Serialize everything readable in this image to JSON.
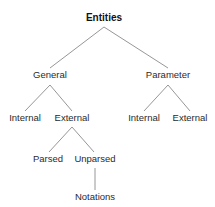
{
  "diagram": {
    "title": "Entities",
    "type": "tree",
    "background_color": "#ffffff",
    "line_color": "#8a8a8a",
    "text_color": "#2b2b2b",
    "nodes": [
      {
        "id": "entities",
        "label": "Entities",
        "x": 104,
        "y": 21,
        "level": 0,
        "bold": true
      },
      {
        "id": "general",
        "label": "General",
        "x": 50,
        "y": 78,
        "level": 1,
        "bold": false
      },
      {
        "id": "parameter",
        "label": "Parameter",
        "x": 168,
        "y": 78,
        "level": 1,
        "bold": false
      },
      {
        "id": "gen-internal",
        "label": "Internal",
        "x": 25,
        "y": 121,
        "level": 2,
        "bold": false
      },
      {
        "id": "gen-external",
        "label": "External",
        "x": 72,
        "y": 121,
        "level": 2,
        "bold": false
      },
      {
        "id": "param-internal",
        "label": "Internal",
        "x": 144,
        "y": 121,
        "level": 2,
        "bold": false
      },
      {
        "id": "param-external",
        "label": "External",
        "x": 190,
        "y": 121,
        "level": 2,
        "bold": false
      },
      {
        "id": "parsed",
        "label": "Parsed",
        "x": 48,
        "y": 162,
        "level": 3,
        "bold": false
      },
      {
        "id": "unparsed",
        "label": "Unparsed",
        "x": 95,
        "y": 162,
        "level": 3,
        "bold": false
      },
      {
        "id": "notations",
        "label": "Notations",
        "x": 95,
        "y": 200,
        "level": 4,
        "bold": false
      }
    ],
    "edges": [
      {
        "id": "entities-general",
        "from": "entities",
        "to": "general",
        "x1": 104,
        "y1": 27,
        "x2": 50,
        "y2": 68
      },
      {
        "id": "entities-parameter",
        "from": "entities",
        "to": "parameter",
        "x1": 104,
        "y1": 27,
        "x2": 168,
        "y2": 68
      },
      {
        "id": "general-internal",
        "from": "general",
        "to": "gen-internal",
        "x1": 50,
        "y1": 85,
        "x2": 25,
        "y2": 111
      },
      {
        "id": "general-external",
        "from": "general",
        "to": "gen-external",
        "x1": 50,
        "y1": 85,
        "x2": 72,
        "y2": 111
      },
      {
        "id": "parameter-internal",
        "from": "parameter",
        "to": "param-internal",
        "x1": 168,
        "y1": 85,
        "x2": 144,
        "y2": 111
      },
      {
        "id": "parameter-external",
        "from": "parameter",
        "to": "param-external",
        "x1": 168,
        "y1": 85,
        "x2": 190,
        "y2": 111
      },
      {
        "id": "external-parsed",
        "from": "gen-external",
        "to": "parsed",
        "x1": 72,
        "y1": 127,
        "x2": 49,
        "y2": 152
      },
      {
        "id": "external-unparsed",
        "from": "gen-external",
        "to": "unparsed",
        "x1": 72,
        "y1": 127,
        "x2": 94,
        "y2": 152
      },
      {
        "id": "unparsed-notations",
        "from": "unparsed",
        "to": "notations",
        "x1": 95,
        "y1": 168,
        "x2": 95,
        "y2": 190
      }
    ]
  }
}
